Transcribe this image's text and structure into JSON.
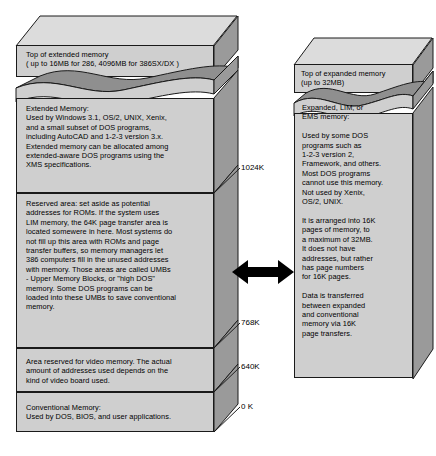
{
  "diagram": {
    "colors": {
      "front_face": "#cfcfcf",
      "side_face": "#9a9a9a",
      "lid_face": "#dcdcdc",
      "wave_dark": "#8f8f8f",
      "outline": "#1a1a1a",
      "arrow": "#000000",
      "background": "#ffffff"
    }
  },
  "left_column": {
    "name": "extended-memory-column",
    "blocks": [
      {
        "id": "top-of-extended-memory",
        "text": "Top of extended memory\n( up to 16MB for 286, 4096MB for 386SX/DX  )"
      },
      {
        "id": "extended-memory",
        "text": "Extended Memory:\nUsed by Windows 3.1, OS/2, UNIX, Xenix,\nand a small subset of DOS programs,\nincluding AutoCAD and 1-2-3 version 3.x.\nExtended memory can be allocated among\nextended-aware DOS programs using the\nXMS specifications."
      },
      {
        "id": "reserved-area",
        "text": "Reserved area: set aside as potential\naddresses for ROMs. If the system uses\nLIM memory, the 64K page transfer area is\nlocated somewere in here. Most systems do\nnot fill up this area with ROMs and  page\ntransfer buffers, so memory managers let\n386 computers fill in the unused addresses\nwith memory. Those areas are called UMBs\n- Upper Memory Blocks, or \"high DOS\"\nmemory. Some DOS  programs can be\nloaded into these UMBs to save conventional\nmemory."
      },
      {
        "id": "video-memory-area",
        "text": "Area reserved for video memory. The actual\namount of addresses used depends on the\nkind of video board used."
      },
      {
        "id": "conventional-memory",
        "text": "Conventional Memory:\nUsed by DOS, BIOS, and user applications."
      }
    ]
  },
  "right_column": {
    "name": "expanded-memory-column",
    "blocks": [
      {
        "id": "top-of-expanded-memory",
        "text": "Top of expanded memory\n(up to 32MB)"
      },
      {
        "id": "expanded-memory",
        "text": "Expanded, LIM, or\nEMS memory:\n\nUsed by some DOS\nprograms such as\n1-2-3 version 2,\nFramework, and others.\nMost DOS programs\ncannot use this memory.\nNot used by Xenix,\nOS/2, UNIX.\n\nIt is arranged into 16K\npages of memory, to\na maximum of 32MB.\nIt does not have\naddresses, but rather\nhas page numbers\nfor 16K pages.\n\nData is transferred\nbetween expanded\nand conventional\nmemory via 16K\npage transfers."
      }
    ]
  },
  "address_labels": [
    {
      "id": "addr-1024k",
      "text": "1024K"
    },
    {
      "id": "addr-768k",
      "text": "768K"
    },
    {
      "id": "addr-640k",
      "text": "640K"
    },
    {
      "id": "addr-0k",
      "text": "0 K"
    }
  ],
  "connector": {
    "id": "transfer-arrow",
    "type": "double-headed-arrow",
    "meaning": "16K page transfers between expanded and conventional memory"
  }
}
